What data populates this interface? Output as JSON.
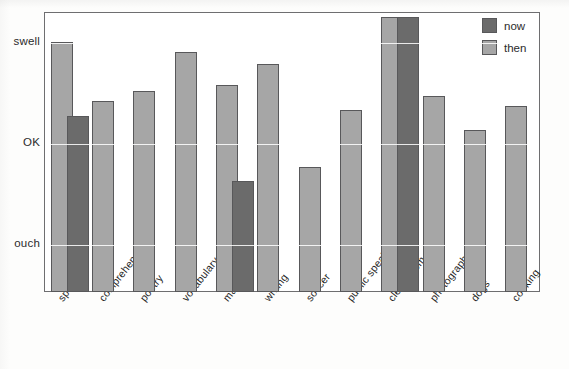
{
  "chart_data": {
    "type": "bar",
    "title": "",
    "xlabel": "",
    "ylabel": "",
    "grid": true,
    "legend_position": "top-right",
    "ytick_labels": [
      "swell",
      "OK",
      "ouch"
    ],
    "ytick_values": [
      3,
      2,
      1
    ],
    "ylim": [
      0.52,
      3.3
    ],
    "categories": [
      "spelling",
      "comprehension",
      "poetry",
      "vocabulary",
      "math",
      "writing",
      "soccer",
      "public speaking",
      "clean room",
      "photography",
      "dogs",
      "cooking"
    ],
    "series": [
      {
        "name": "then",
        "color": "#a6a6a6",
        "values": [
          3.0,
          2.42,
          2.52,
          2.9,
          2.58,
          2.78,
          1.76,
          2.33,
          3.25,
          2.47,
          2.13,
          2.37
        ]
      },
      {
        "name": "now",
        "color": "#6b6b6b",
        "values": [
          2.27,
          null,
          null,
          null,
          1.62,
          null,
          null,
          null,
          3.25,
          null,
          null,
          null
        ]
      }
    ]
  },
  "legend": {
    "items": [
      {
        "label": "now",
        "color": "#6b6b6b",
        "swatch": "legend-swatch-now"
      },
      {
        "label": "then",
        "color": "#a6a6a6",
        "swatch": "legend-swatch-then"
      }
    ]
  },
  "axes": {
    "y": {
      "ticks": [
        {
          "label": "swell",
          "value": 3
        },
        {
          "label": "OK",
          "value": 2
        },
        {
          "label": "ouch",
          "value": 1
        }
      ]
    }
  }
}
